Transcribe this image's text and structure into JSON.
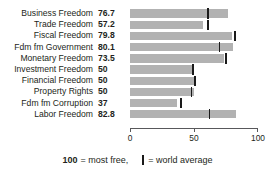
{
  "chart_data": {
    "type": "bar",
    "orientation": "horizontal",
    "title": "",
    "xlabel": "",
    "ylabel": "",
    "xlim": [
      0,
      100
    ],
    "xticks": [
      0,
      50,
      100
    ],
    "xtick_labels": [
      "0",
      "50",
      "100"
    ],
    "grid": false,
    "legend_position": "bottom",
    "bar_color": "#b2b2b2",
    "marker_color": "#1a1a1a",
    "categories": [
      "Business Freedom",
      "Trade Freedom",
      "Fiscal Freedom",
      "Fdm fm Government",
      "Monetary Freedom",
      "Investment Freedom",
      "Financial Freedom",
      "Property Rights",
      "Fdm fm Corruption",
      "Labor Freedom"
    ],
    "values": [
      76.7,
      57.2,
      79.8,
      80.1,
      73.5,
      50,
      50,
      50,
      37,
      82.8
    ],
    "value_labels": [
      "76.7",
      "57.2",
      "79.8",
      "80.1",
      "73.5",
      "50",
      "50",
      "50",
      "37",
      "82.8"
    ],
    "series": [
      {
        "name": "Score",
        "values": [
          76.7,
          57.2,
          79.8,
          80.1,
          73.5,
          50,
          50,
          50,
          37,
          82.8
        ]
      },
      {
        "name": "World average",
        "values": [
          61,
          61,
          82,
          70,
          75,
          49,
          51,
          48,
          40,
          62
        ]
      }
    ],
    "rows": [
      {
        "label": "Business Freedom",
        "value": 76.7,
        "value_label": "76.7",
        "world_average": 61
      },
      {
        "label": "Trade Freedom",
        "value": 57.2,
        "value_label": "57.2",
        "world_average": 61
      },
      {
        "label": "Fiscal Freedom",
        "value": 79.8,
        "value_label": "79.8",
        "world_average": 82
      },
      {
        "label": "Fdm fm Government",
        "value": 80.1,
        "value_label": "80.1",
        "world_average": 70
      },
      {
        "label": "Monetary Freedom",
        "value": 73.5,
        "value_label": "73.5",
        "world_average": 75
      },
      {
        "label": "Investment Freedom",
        "value": 50,
        "value_label": "50",
        "world_average": 49
      },
      {
        "label": "Financial Freedom",
        "value": 50,
        "value_label": "50",
        "world_average": 51
      },
      {
        "label": "Property Rights",
        "value": 50,
        "value_label": "50",
        "world_average": 48
      },
      {
        "label": "Fdm fm Corruption",
        "value": 37,
        "value_label": "37",
        "world_average": 40
      },
      {
        "label": "Labor Freedom",
        "value": 82.8,
        "value_label": "82.8",
        "world_average": 62
      }
    ]
  },
  "footer": {
    "max_value_label": "100",
    "most_free_text": "= most free,",
    "world_average_text": "= world average"
  }
}
